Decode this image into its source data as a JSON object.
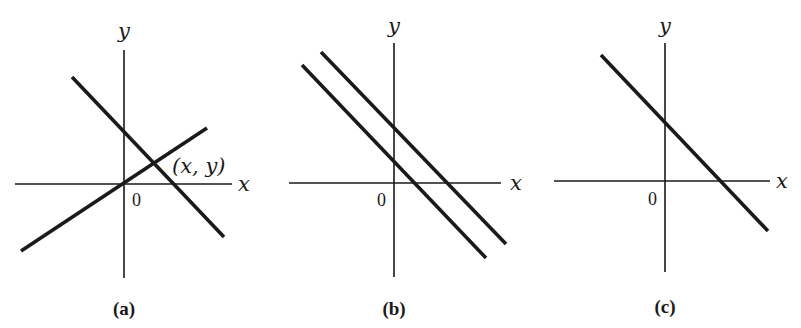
{
  "figure": {
    "panels": [
      {
        "id": "a",
        "caption": "(a)",
        "x_axis_label": "x",
        "y_axis_label": "y",
        "origin_label": "0",
        "point_label": "(x, y)",
        "description": "Two lines intersecting at a single point (x, y)",
        "lines": [
          {
            "name": "decreasing-line",
            "slope_sign": "negative"
          },
          {
            "name": "increasing-line",
            "slope_sign": "positive",
            "passes_through_origin": true
          }
        ]
      },
      {
        "id": "b",
        "caption": "(b)",
        "x_axis_label": "x",
        "y_axis_label": "y",
        "origin_label": "0",
        "description": "Two parallel lines (no intersection)",
        "lines": [
          {
            "name": "upper-parallel-line",
            "slope_sign": "negative"
          },
          {
            "name": "lower-parallel-line",
            "slope_sign": "negative"
          }
        ]
      },
      {
        "id": "c",
        "caption": "(c)",
        "x_axis_label": "x",
        "y_axis_label": "y",
        "origin_label": "0",
        "description": "Two coincident lines (drawn as one line)",
        "lines": [
          {
            "name": "coincident-line",
            "slope_sign": "negative"
          }
        ]
      }
    ]
  }
}
